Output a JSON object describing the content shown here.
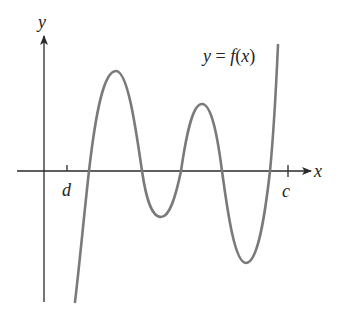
{
  "figure": {
    "type": "function-graph",
    "function_label": {
      "y": "y",
      "eq": " = ",
      "f": "f",
      "open": "(",
      "x": "x",
      "close": ")"
    },
    "axes": {
      "x_label": "x",
      "y_label": "y",
      "color": "#2a2a2a"
    },
    "ticks": [
      {
        "label": "d",
        "position": "left of first zero, right of y-axis"
      },
      {
        "label": "c",
        "position": "right of last zero"
      }
    ],
    "curve": {
      "color": "#7a7a7a",
      "description": "Continuous curve crossing the x-axis four times between d and c, with two local maxima and two local minima; rises steeply beyond c",
      "zero_crossings": 4,
      "local_maxima": 2,
      "local_minima": 2
    }
  }
}
